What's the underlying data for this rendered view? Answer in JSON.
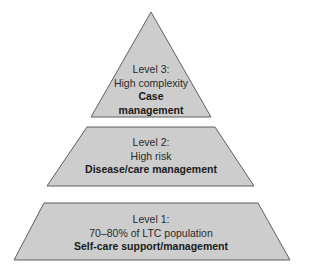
{
  "diagram": {
    "type": "pyramid",
    "colors": {
      "fill": "#cdcdcd",
      "stroke": "#5f5f5f",
      "background": "#ffffff"
    },
    "levels": [
      {
        "id": "level-3",
        "heading": "Level 3:",
        "subtitle": "High complexity",
        "bold_line1": "Case",
        "bold_line2": "management"
      },
      {
        "id": "level-2",
        "heading": "Level 2:",
        "subtitle": "High risk",
        "bold_line1": "Disease/care management"
      },
      {
        "id": "level-1",
        "heading": "Level 1:",
        "subtitle": "70–80% of LTC population",
        "bold_line1": "Self-care support/management"
      }
    ]
  }
}
